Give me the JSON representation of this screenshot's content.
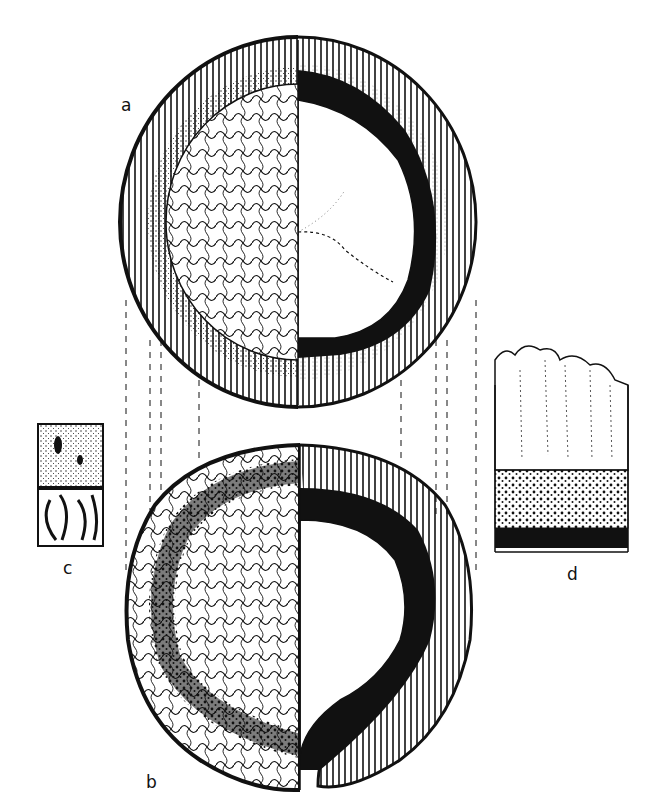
{
  "figure": {
    "panels": [
      {
        "id": "a",
        "label": "a",
        "label_pos": [
          121,
          95
        ],
        "description": "cross-section, half showing surface texture, half showing interior with dark ring"
      },
      {
        "id": "b",
        "label": "b",
        "label_pos": [
          146,
          782
        ],
        "description": "cross-section with tapering dark band and split base"
      },
      {
        "id": "c",
        "label": "c",
        "label_pos": [
          63,
          568
        ],
        "description": "small detail inset of tissue texture"
      },
      {
        "id": "d",
        "label": "d",
        "label_pos": [
          567,
          574
        ],
        "description": "layered column: ridged top, stippled middle, solid black base"
      }
    ],
    "guide_lines_x": [
      126,
      150,
      161,
      199,
      401,
      436,
      447,
      476
    ],
    "colors": {
      "ink": "#111111",
      "paper": "#ffffff"
    }
  }
}
